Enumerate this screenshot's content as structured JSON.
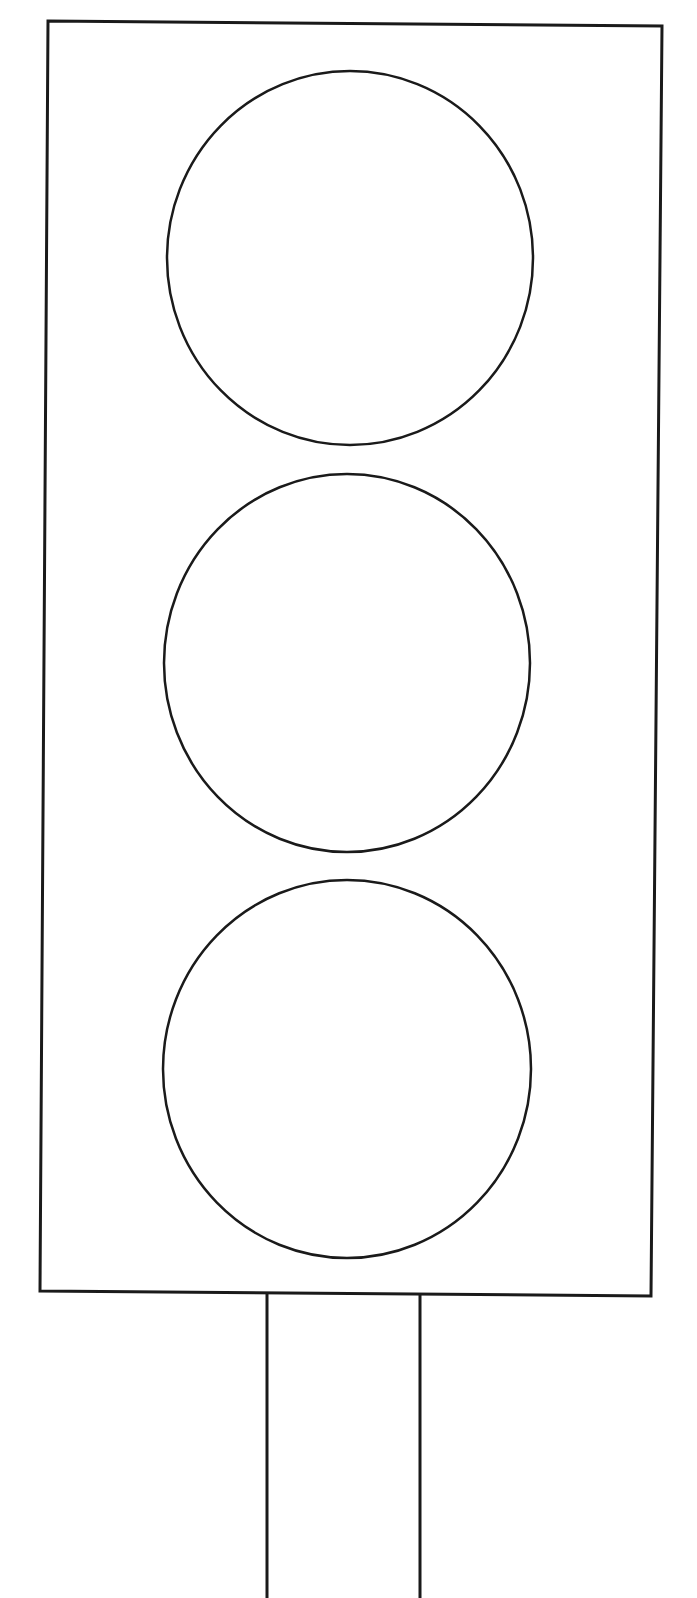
{
  "figure": {
    "stroke_color": "#1a1a1a",
    "background": "#ffffff",
    "housing": {
      "points": [
        [
          48,
          21
        ],
        [
          662,
          26
        ],
        [
          651,
          1296
        ],
        [
          40,
          1291
        ]
      ]
    },
    "lights": [
      {
        "name": "top-light",
        "cx": 350,
        "cy": 258,
        "rx": 183,
        "ry": 187
      },
      {
        "name": "middle-light",
        "cx": 347,
        "cy": 663,
        "rx": 183,
        "ry": 189
      },
      {
        "name": "bottom-light",
        "cx": 347,
        "cy": 1069,
        "rx": 184,
        "ry": 189
      }
    ],
    "pole": {
      "left_x": 267,
      "right_x": 420,
      "top_y": 1293,
      "bottom_y": 1598
    }
  }
}
